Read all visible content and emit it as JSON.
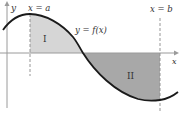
{
  "diagram": {
    "axes": {
      "x_label": "x",
      "y_label": "y"
    },
    "curve": {
      "label": "y = f(x)"
    },
    "bounds": {
      "left_label": "x = a",
      "right_label": "x = b"
    },
    "regions": [
      {
        "label": "I",
        "position": "above x-axis",
        "fill": "#d8d8d8"
      },
      {
        "label": "II",
        "position": "below x-axis",
        "fill": "#a9a9a9"
      }
    ],
    "colors": {
      "curve": "#1a1a1a",
      "axis": "#9a9a9a",
      "dashed": "#8a8a8a"
    }
  }
}
